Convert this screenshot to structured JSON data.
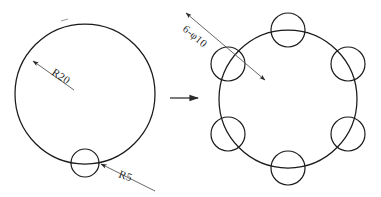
{
  "drawing": {
    "background_color": "#ffffff",
    "line_color": "#1a1a1a",
    "leader_color": "#555555",
    "text_color": "#2b2b2b",
    "width": 381,
    "height": 197
  },
  "left_figure": {
    "name": "blank-with-single-notch",
    "main_circle": {
      "label": "R20",
      "cx": 85,
      "cy": 94,
      "r": 70
    },
    "notch_circle": {
      "label": "R5",
      "cx": 85,
      "cy": 163,
      "r": 14
    },
    "leaders": {
      "r20": {
        "text": "R20",
        "text_x": 51,
        "text_y": 74,
        "rotate": 34,
        "line_x1": 33,
        "line_y1": 61,
        "line_x2": 74,
        "line_y2": 90,
        "arrow_at": "start"
      },
      "r5": {
        "text": "R5",
        "text_x": 118,
        "text_y": 177,
        "rotate": 0,
        "line_x1": 101,
        "line_y1": 164,
        "line_x2": 155,
        "line_y2": 191,
        "arrow_at": "start"
      }
    },
    "tick_mark": {
      "x1": 61,
      "y1": 21,
      "x2": 68,
      "y2": 19
    }
  },
  "transform_arrow": {
    "label": "becomes",
    "x1": 170,
    "y1": 98,
    "x2": 201,
    "y2": 98
  },
  "right_figure": {
    "name": "six-hole-bolt-circle",
    "bolt_circle": {
      "cx": 288,
      "cy": 99,
      "r": 69
    },
    "hole_count": 6,
    "hole_radius": 17,
    "hole_label": "6-φ10",
    "hole_angles_deg": [
      270,
      330,
      30,
      90,
      150,
      210
    ],
    "holes": [
      {
        "cx": 288,
        "cy": 30
      },
      {
        "cx": 348,
        "cy": 64
      },
      {
        "cx": 348,
        "cy": 134
      },
      {
        "cx": 288,
        "cy": 168
      },
      {
        "cx": 228,
        "cy": 134
      },
      {
        "cx": 228,
        "cy": 64
      }
    ],
    "leader": {
      "text": "6-φ10",
      "text_x": 182,
      "text_y": 30,
      "rotate": -40,
      "line_x1": 186,
      "line_y1": 13,
      "line_x2": 265,
      "line_y2": 80,
      "arrow_at": "both"
    }
  }
}
